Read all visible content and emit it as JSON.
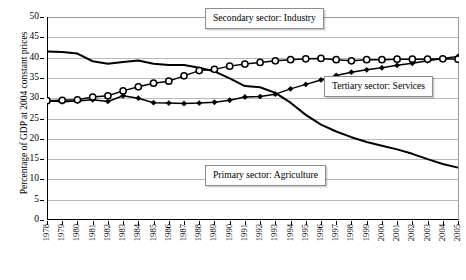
{
  "chart_data": {
    "type": "line",
    "title": "",
    "xlabel": "",
    "ylabel": "Percentage of GDP at 2004 constant prices",
    "ylim": [
      0,
      50
    ],
    "ytick_step": 5,
    "yticks": [
      0,
      5,
      10,
      15,
      20,
      25,
      30,
      35,
      40,
      45,
      50
    ],
    "grid": true,
    "legend_position": "inline-annotations",
    "categories": [
      "1978",
      "1979",
      "1980",
      "1981",
      "1982",
      "1983",
      "1984",
      "1985",
      "1986",
      "1987",
      "1988",
      "1989",
      "1990",
      "1991",
      "1992",
      "1993",
      "1994",
      "1995",
      "1996",
      "1997",
      "1998",
      "1999",
      "2000",
      "2001",
      "2002",
      "2003",
      "2004",
      "2005"
    ],
    "series": [
      {
        "name": "Primary sector: Agriculture",
        "marker": "none",
        "color": "#000000",
        "values": [
          41.5,
          41.4,
          41.0,
          39.1,
          38.5,
          38.9,
          39.3,
          38.5,
          38.2,
          38.2,
          37.5,
          36.6,
          34.9,
          33.0,
          32.7,
          31.3,
          28.9,
          25.9,
          23.5,
          21.8,
          20.4,
          19.2,
          18.3,
          17.4,
          16.3,
          15.0,
          13.8,
          12.9
        ]
      },
      {
        "name": "Secondary sector: Industry",
        "marker": "diamond-filled",
        "color": "#000000",
        "values": [
          29.4,
          29.1,
          29.3,
          29.6,
          29.2,
          30.6,
          30.0,
          28.9,
          28.8,
          28.7,
          28.8,
          29.0,
          29.5,
          30.3,
          30.4,
          31.0,
          32.3,
          33.4,
          34.5,
          35.6,
          36.4,
          37.0,
          37.5,
          38.1,
          38.6,
          39.2,
          39.8,
          40.3
        ]
      },
      {
        "name": "Tertiary sector: Services",
        "marker": "circle-open",
        "color": "#000000",
        "values": [
          29.4,
          29.5,
          29.6,
          30.3,
          30.6,
          31.8,
          32.8,
          33.7,
          34.2,
          35.5,
          36.8,
          37.1,
          37.9,
          38.4,
          38.8,
          39.2,
          39.5,
          39.7,
          39.8,
          39.5,
          39.2,
          39.5,
          39.5,
          39.6,
          39.6,
          39.6,
          39.7,
          39.6
        ]
      }
    ],
    "annotations": [
      {
        "id": "secondary",
        "text": "Secondary sector: Industry"
      },
      {
        "id": "tertiary",
        "text": "Tertiary sector: Services"
      },
      {
        "id": "primary",
        "text": "Primary sector: Agriculture"
      }
    ]
  }
}
